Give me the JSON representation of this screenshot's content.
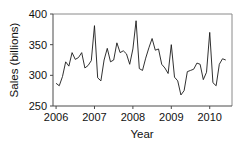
{
  "chart_data": {
    "type": "line",
    "title": "",
    "xlabel": "Year",
    "ylabel": "Sales (billions)",
    "xlim": [
      2005.92,
      2010.58
    ],
    "ylim": [
      250,
      400
    ],
    "yticks": [
      250,
      300,
      350,
      400
    ],
    "ytick_labels": [
      "250",
      "300",
      "350",
      "400"
    ],
    "xticks": [
      2006,
      2007,
      2008,
      2009,
      2010
    ],
    "xtick_labels": [
      "2006",
      "2007",
      "2008",
      "2009",
      "2010"
    ],
    "grid": false,
    "legend": false,
    "legend_position": "none",
    "line_color": "#1a1a1a",
    "axis_color": "#4a4a4a",
    "frame_color": "#8a8a8a",
    "series": [
      {
        "name": "Sales",
        "x": [
          2006.0,
          2006.083,
          2006.167,
          2006.25,
          2006.333,
          2006.417,
          2006.5,
          2006.583,
          2006.667,
          2006.75,
          2006.833,
          2006.917,
          2007.0,
          2007.083,
          2007.167,
          2007.25,
          2007.333,
          2007.417,
          2007.5,
          2007.583,
          2007.667,
          2007.75,
          2007.833,
          2007.917,
          2008.0,
          2008.083,
          2008.167,
          2008.25,
          2008.333,
          2008.417,
          2008.5,
          2008.583,
          2008.667,
          2008.75,
          2008.833,
          2008.917,
          2009.0,
          2009.083,
          2009.167,
          2009.25,
          2009.333,
          2009.417,
          2009.5,
          2009.583,
          2009.667,
          2009.75,
          2009.833,
          2009.917,
          2010.0,
          2010.083,
          2010.167,
          2010.25,
          2010.333,
          2010.417
        ],
        "values": [
          287,
          283,
          298,
          322,
          315,
          337,
          326,
          329,
          337,
          312,
          316,
          324,
          381,
          296,
          291,
          325,
          344,
          322,
          325,
          353,
          337,
          340,
          335,
          318,
          343,
          389,
          311,
          308,
          328,
          345,
          360,
          341,
          343,
          318,
          312,
          303,
          350,
          297,
          291,
          268,
          275,
          306,
          308,
          310,
          320,
          318,
          293,
          305,
          370,
          288,
          283,
          318,
          327,
          325
        ]
      }
    ]
  }
}
